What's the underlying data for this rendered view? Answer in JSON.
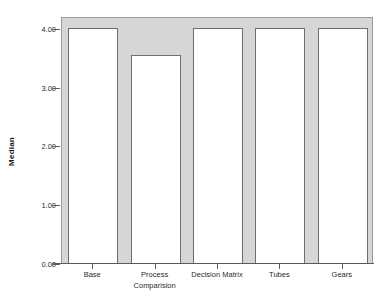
{
  "chart_data": {
    "type": "bar",
    "title": "",
    "subtitle": "",
    "xlabel": "Comparision",
    "ylabel": "Median",
    "categories": [
      "Base",
      "Process",
      "Decision Matrix",
      "Tubes",
      "Gears"
    ],
    "values": [
      4.0,
      3.53,
      4.0,
      4.0,
      4.0
    ],
    "series": [
      {
        "name": "Median",
        "values": [
          4.0,
          3.53,
          4.0,
          4.0,
          4.0
        ]
      }
    ],
    "ylim": [
      0,
      4.2
    ],
    "yticks": [
      0.0,
      1.0,
      2.0,
      3.0,
      4.0
    ],
    "ytick_labels": [
      "0.00",
      "1.00",
      "2.00",
      "3.00",
      "4.00"
    ],
    "xtick_labels": [
      "Base",
      "Process",
      "Decision Matrix",
      "Tubes",
      "Gears"
    ],
    "grid": false,
    "legend": false,
    "legend_position": "none",
    "annotations": [],
    "colors": {
      "plot_background": "#d6d6d6",
      "figure_background": "#ffffff",
      "bar_fill": "#ffffff",
      "bar_edge": "#6e6e6e",
      "axis": "#5a5a5a",
      "text": "#2b2b2b"
    }
  }
}
